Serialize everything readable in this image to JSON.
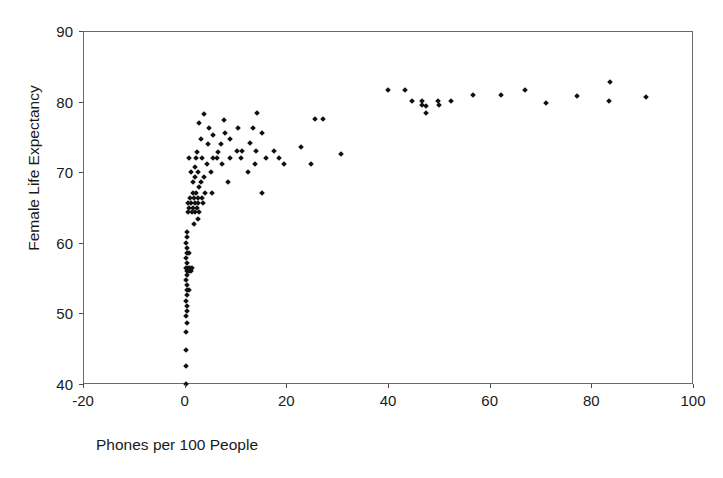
{
  "chart_data": {
    "type": "scatter",
    "title": "",
    "xlabel": "Phones per 100 People",
    "ylabel": "Female Life Expectancy",
    "xlim": [
      -20,
      100
    ],
    "ylim": [
      40,
      90
    ],
    "xticks": [
      -20,
      0,
      20,
      40,
      60,
      80,
      100
    ],
    "yticks": [
      40,
      50,
      60,
      70,
      80,
      90
    ],
    "xtick_labels": [
      "-20",
      "0",
      "20",
      "40",
      "60",
      "80",
      "100"
    ],
    "ytick_labels": [
      "40",
      "50",
      "60",
      "70",
      "80",
      "90"
    ],
    "grid": false,
    "legend": false,
    "marker": "diamond",
    "marker_color": "#111111",
    "marker_size_px": 4,
    "frame_color": "#6a6a6a",
    "background": "#ffffff",
    "n_points": 121,
    "series": [
      {
        "name": "Countries",
        "points": [
          [
            0.2,
            40.0
          ],
          [
            0.2,
            42.5
          ],
          [
            0.3,
            44.8
          ],
          [
            0.3,
            47.3
          ],
          [
            0.4,
            48.6
          ],
          [
            0.3,
            49.6
          ],
          [
            0.4,
            50.3
          ],
          [
            0.4,
            51.1
          ],
          [
            0.3,
            51.8
          ],
          [
            0.5,
            52.6
          ],
          [
            0.4,
            53.3
          ],
          [
            0.9,
            53.3
          ],
          [
            0.4,
            54.0
          ],
          [
            0.3,
            54.7
          ],
          [
            0.5,
            55.4
          ],
          [
            0.4,
            56.0
          ],
          [
            0.8,
            56.0
          ],
          [
            1.2,
            56.0
          ],
          [
            0.3,
            56.5
          ],
          [
            0.7,
            56.5
          ],
          [
            1.1,
            56.5
          ],
          [
            1.5,
            56.5
          ],
          [
            0.4,
            57.2
          ],
          [
            0.3,
            57.9
          ],
          [
            0.5,
            58.6
          ],
          [
            0.9,
            58.6
          ],
          [
            0.4,
            59.3
          ],
          [
            0.3,
            60.0
          ],
          [
            0.5,
            60.8
          ],
          [
            0.4,
            61.5
          ],
          [
            1.8,
            62.6
          ],
          [
            2.6,
            63.4
          ],
          [
            0.7,
            64.3
          ],
          [
            1.4,
            64.3
          ],
          [
            2.1,
            64.3
          ],
          [
            2.8,
            64.3
          ],
          [
            0.8,
            65.0
          ],
          [
            1.6,
            65.0
          ],
          [
            2.4,
            65.0
          ],
          [
            0.6,
            65.7
          ],
          [
            1.3,
            65.7
          ],
          [
            2.0,
            65.7
          ],
          [
            2.7,
            65.7
          ],
          [
            3.6,
            65.7
          ],
          [
            1.1,
            66.4
          ],
          [
            1.9,
            66.4
          ],
          [
            2.6,
            66.4
          ],
          [
            3.4,
            66.4
          ],
          [
            1.6,
            67.1
          ],
          [
            2.3,
            67.1
          ],
          [
            4.0,
            67.1
          ],
          [
            5.4,
            67.1
          ],
          [
            15.3,
            67.1
          ],
          [
            2.9,
            67.9
          ],
          [
            1.6,
            68.6
          ],
          [
            3.2,
            68.6
          ],
          [
            8.5,
            68.6
          ],
          [
            2.1,
            69.3
          ],
          [
            3.9,
            69.3
          ],
          [
            1.3,
            70.0
          ],
          [
            2.6,
            70.0
          ],
          [
            5.2,
            70.0
          ],
          [
            12.4,
            70.0
          ],
          [
            2.0,
            70.8
          ],
          [
            4.4,
            71.1
          ],
          [
            7.4,
            71.1
          ],
          [
            13.8,
            71.1
          ],
          [
            19.6,
            71.1
          ],
          [
            24.8,
            71.1
          ],
          [
            0.9,
            72.0
          ],
          [
            2.3,
            72.0
          ],
          [
            3.4,
            72.0
          ],
          [
            5.6,
            72.0
          ],
          [
            6.4,
            72.0
          ],
          [
            8.9,
            72.0
          ],
          [
            11.0,
            72.0
          ],
          [
            16.0,
            72.0
          ],
          [
            18.6,
            72.0
          ],
          [
            30.7,
            72.6
          ],
          [
            2.4,
            72.8
          ],
          [
            6.5,
            72.8
          ],
          [
            10.2,
            73.0
          ],
          [
            11.3,
            73.0
          ],
          [
            14.0,
            73.0
          ],
          [
            17.5,
            73.0
          ],
          [
            22.8,
            73.6
          ],
          [
            4.5,
            74.0
          ],
          [
            7.2,
            74.0
          ],
          [
            12.8,
            74.1
          ],
          [
            3.3,
            74.7
          ],
          [
            9.0,
            74.7
          ],
          [
            5.6,
            75.3
          ],
          [
            8.0,
            75.6
          ],
          [
            15.2,
            75.6
          ],
          [
            4.8,
            76.3
          ],
          [
            10.5,
            76.3
          ],
          [
            13.4,
            76.3
          ],
          [
            2.9,
            77.0
          ],
          [
            7.7,
            77.4
          ],
          [
            25.6,
            77.6
          ],
          [
            27.2,
            77.6
          ],
          [
            3.9,
            78.3
          ],
          [
            14.2,
            78.4
          ],
          [
            47.4,
            78.4
          ],
          [
            47.4,
            79.4
          ],
          [
            44.8,
            80.1
          ],
          [
            46.6,
            80.1
          ],
          [
            49.8,
            80.1
          ],
          [
            52.3,
            80.1
          ],
          [
            83.5,
            80.1
          ],
          [
            46.6,
            79.5
          ],
          [
            50.0,
            79.5
          ],
          [
            71.0,
            79.8
          ],
          [
            40.0,
            81.7
          ],
          [
            43.4,
            81.7
          ],
          [
            56.7,
            80.9
          ],
          [
            62.3,
            81.0
          ],
          [
            77.2,
            80.8
          ],
          [
            90.8,
            80.7
          ],
          [
            67.0,
            81.6
          ],
          [
            83.6,
            82.8
          ]
        ]
      }
    ]
  },
  "axis": {
    "y_title": "Female Life Expectancy",
    "x_title": "Phones per 100 People"
  }
}
